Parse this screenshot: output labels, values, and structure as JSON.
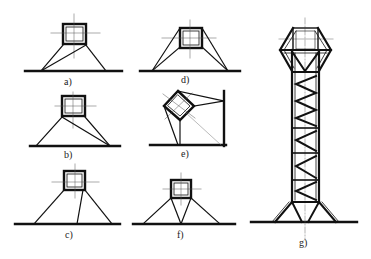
{
  "figure": {
    "panels": [
      {
        "id": "a",
        "label": "a)",
        "description": "square section on two legs, one diagonal brace to left foot"
      },
      {
        "id": "b",
        "label": "b)",
        "description": "square section on two legs, diagonal brace to right foot"
      },
      {
        "id": "c",
        "label": "c)",
        "description": "square section with two inclined legs and one near-vertical strut"
      },
      {
        "id": "d",
        "label": "d)",
        "description": "square section with double legs each side (braced trapezoid)"
      },
      {
        "id": "e",
        "label": "e)",
        "description": "rotated square section braced to floor and to vertical wall"
      },
      {
        "id": "f",
        "label": "f)",
        "description": "square section with four legs converging to a central foot (W-support)"
      },
      {
        "id": "g",
        "label": "g)",
        "description": "tall lattice tower with zigzag bracing, hexagonal top frame and splayed base"
      }
    ],
    "caption": "",
    "colors": {
      "line": "#111111",
      "centerline": "#555555",
      "background": "#ffffff"
    }
  }
}
